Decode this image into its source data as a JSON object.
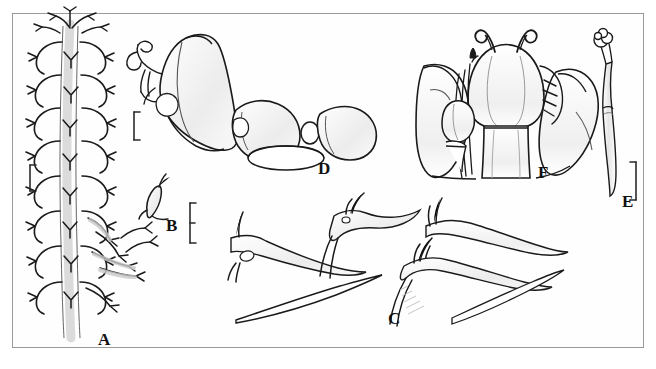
{
  "figure": {
    "type": "scientific-line-illustration-plate",
    "background_color": "#ffffff",
    "frame_color": "#9a9a9a",
    "ink_color": "#1a1a1a",
    "shading_color": "#d8d8d8",
    "panel_count": 6
  },
  "panels": [
    {
      "id": "A",
      "label": "A",
      "label_x": 98,
      "label_y": 331,
      "subject": "branched-spine-row-on-axis",
      "description": "Longitudinal axis bearing paired, recurved, forked lateral spines",
      "scale_bars": [
        {
          "name": "scale-bar-A",
          "x": 30,
          "y": 165,
          "length": 26,
          "orientation": "vertical"
        }
      ]
    },
    {
      "id": "B",
      "label": "B",
      "label_x": 166,
      "label_y": 217,
      "subject": "single-small-spine",
      "description": "Isolated small spine with a basal denticle",
      "scale_bars": [
        {
          "name": "scale-bar-B",
          "x": 190,
          "y": 205,
          "length": 40,
          "orientation": "vertical"
        }
      ]
    },
    {
      "id": "C",
      "label": "C",
      "label_x": 388,
      "label_y": 310,
      "subject": "elongate-setae-group",
      "description": "Four elongate, tapering setae with basal swellings and apical denticles",
      "scale_bars": []
    },
    {
      "id": "D",
      "label": "D",
      "label_x": 318,
      "label_y": 160,
      "subject": "funnel-shaped-appendage",
      "description": "Trumpet or funnel shaped structure attached to two rounded segments",
      "scale_bars": [
        {
          "name": "scale-bar-D",
          "x": 134,
          "y": 113,
          "length": 28,
          "orientation": "vertical"
        }
      ]
    },
    {
      "id": "E",
      "label": "E",
      "label_x": 622,
      "label_y": 193,
      "subject": "slender-appendage-with-knob",
      "description": "Slender curved appendage terminating in a lobed knob",
      "scale_bars": [
        {
          "name": "scale-bar-E",
          "x": 636,
          "y": 163,
          "length": 38,
          "orientation": "vertical"
        }
      ]
    },
    {
      "id": "F",
      "label": "F",
      "label_x": 538,
      "label_y": 164,
      "subject": "cephalic-region-ventral-view",
      "description": "Bilaterally symmetrical head region with paired coiled antennae and lateral flanges",
      "scale_bars": []
    }
  ]
}
